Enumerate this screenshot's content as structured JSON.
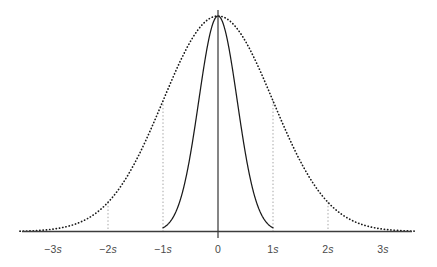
{
  "chart_data": {
    "type": "line",
    "title": "",
    "subtitle": "",
    "xlabel": "",
    "ylabel": "",
    "grid": false,
    "legend_position": "none",
    "xlim": [
      -3.6,
      3.6
    ],
    "ylim": [
      0,
      1.05
    ],
    "x_tick_values": [
      -3,
      -2,
      -1,
      0,
      1,
      2,
      3
    ],
    "x_tick_labels": [
      "−3s",
      "−2s",
      "−1s",
      "0",
      "1s",
      "2s",
      "3s"
    ],
    "x_tick_numbers": [
      "−3",
      "−2",
      "−1",
      "0",
      "1",
      "2",
      "3"
    ],
    "x_tick_unit": "s",
    "annotations": {
      "guideline_positions": [
        -2,
        -1,
        1,
        2
      ],
      "guideline_style": "dotted",
      "baseline_style": "solid",
      "vertical_axis_at": 0
    },
    "series": [
      {
        "name": "narrow-distribution",
        "style": "solid",
        "color": "#1a1a1a",
        "mean": 0,
        "sigma": 0.35,
        "peak_value": 1.0,
        "x": [
          -1.0,
          -0.9,
          -0.8,
          -0.7,
          -0.6,
          -0.5,
          -0.4,
          -0.3,
          -0.2,
          -0.1,
          0,
          0.1,
          0.2,
          0.3,
          0.4,
          0.5,
          0.6,
          0.7,
          0.8,
          0.9,
          1.0
        ],
        "values": [
          0.017,
          0.037,
          0.074,
          0.135,
          0.233,
          0.362,
          0.519,
          0.68,
          0.848,
          0.96,
          1.0,
          0.96,
          0.848,
          0.68,
          0.519,
          0.362,
          0.233,
          0.135,
          0.074,
          0.037,
          0.017
        ]
      },
      {
        "name": "wide-distribution",
        "style": "dotted",
        "color": "#1a1a1a",
        "mean": 0,
        "sigma": 1.0,
        "peak_value": 1.0,
        "x": [
          -3.6,
          -3.2,
          -2.8,
          -2.4,
          -2.0,
          -1.6,
          -1.2,
          -0.8,
          -0.4,
          0,
          0.4,
          0.8,
          1.2,
          1.6,
          2.0,
          2.4,
          2.8,
          3.2,
          3.6
        ],
        "values": [
          0.0015,
          0.006,
          0.0198,
          0.0561,
          0.1353,
          0.278,
          0.4868,
          0.7261,
          0.9231,
          1.0,
          0.9231,
          0.7261,
          0.4868,
          0.278,
          0.1353,
          0.0561,
          0.0198,
          0.006,
          0.0015
        ]
      }
    ]
  },
  "colors": {
    "curve": "#1a1a1a",
    "axis": "#3c3c3c",
    "guideline": "#9a9a9a",
    "label": "#4a4a4a",
    "background": "#ffffff"
  }
}
